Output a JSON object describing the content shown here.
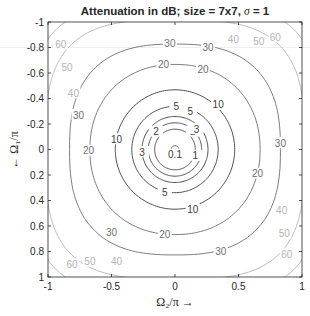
{
  "chart_data": {
    "type": "contour",
    "title": "Attenuation in dB; size = 7x7, σ = 1",
    "title_parts": {
      "prefix": "Attenuation in dB; size = 7x7, ",
      "sigma": "σ",
      "suffix": " = 1"
    },
    "xlabel": "Ω₂/π →",
    "ylabel": "← Ω₁/π",
    "xlim": [
      -1,
      1
    ],
    "ylim": [
      -1,
      1
    ],
    "y_axis_reversed": true,
    "grid": false,
    "x_ticks": [
      -1,
      -0.5,
      0,
      0.5,
      1
    ],
    "x_tick_labels": [
      "-1",
      "-0.5",
      "0",
      "0.5",
      "1"
    ],
    "y_ticks": [
      -1,
      -0.8,
      -0.6,
      -0.4,
      -0.2,
      0,
      0.2,
      0.4,
      0.6,
      0.8,
      1
    ],
    "y_tick_labels": [
      "-1",
      "-0.8",
      "-0.6",
      "-0.4",
      "-0.2",
      "0",
      "0.2",
      "0.4",
      "0.6",
      "0.8",
      "1"
    ],
    "contour_levels": [
      0.1,
      1,
      2,
      3,
      5,
      10,
      20,
      30,
      40,
      50,
      60
    ],
    "contour_shape": "concentric around origin; levels 0.1–20 near-circular, 30 rounded-square, 40/50/60 arcs in the four corners",
    "contour_radii_normalized": {
      "0.1": 0.03,
      "1": 0.16,
      "2": 0.21,
      "3": 0.26,
      "5": 0.34,
      "10": 0.47,
      "20": 0.67,
      "30": 0.83
    },
    "labels_visible": [
      {
        "level": "60",
        "x": -0.9,
        "y": -0.82
      },
      {
        "level": "50",
        "x": -0.85,
        "y": -0.64
      },
      {
        "level": "40",
        "x": -0.8,
        "y": -0.44
      },
      {
        "level": "30",
        "x": -0.76,
        "y": -0.27
      },
      {
        "level": "20",
        "x": -0.68,
        "y": 0.01
      },
      {
        "level": "10",
        "x": -0.46,
        "y": -0.08
      },
      {
        "level": "3",
        "x": -0.26,
        "y": 0.02
      },
      {
        "level": "2",
        "x": -0.15,
        "y": -0.14
      },
      {
        "level": "0.1",
        "x": 0.0,
        "y": 0.04
      },
      {
        "level": "1",
        "x": 0.16,
        "y": 0.05
      },
      {
        "level": "2",
        "x": 0.14,
        "y": -0.14
      },
      {
        "level": "3",
        "x": 0.17,
        "y": -0.16
      },
      {
        "level": "5",
        "x": 0.01,
        "y": -0.34
      },
      {
        "level": "5",
        "x": 0.12,
        "y": -0.3
      },
      {
        "level": "5",
        "x": -0.08,
        "y": 0.34
      },
      {
        "level": "10",
        "x": 0.34,
        "y": -0.35
      },
      {
        "level": "10",
        "x": 0.14,
        "y": 0.47
      },
      {
        "level": "20",
        "x": -0.09,
        "y": -0.67
      },
      {
        "level": "20",
        "x": 0.22,
        "y": -0.63
      },
      {
        "level": "20",
        "x": 0.65,
        "y": 0.19
      },
      {
        "level": "20",
        "x": -0.08,
        "y": 0.67
      },
      {
        "level": "30",
        "x": -0.04,
        "y": -0.83
      },
      {
        "level": "30",
        "x": 0.26,
        "y": -0.8
      },
      {
        "level": "30",
        "x": 0.83,
        "y": -0.05
      },
      {
        "level": "30",
        "x": -0.5,
        "y": 0.65
      },
      {
        "level": "30",
        "x": 0.36,
        "y": 0.8
      },
      {
        "level": "40",
        "x": 0.46,
        "y": -0.86
      },
      {
        "level": "40",
        "x": 0.84,
        "y": 0.48
      },
      {
        "level": "40",
        "x": -0.46,
        "y": 0.88
      },
      {
        "level": "50",
        "x": 0.66,
        "y": -0.85
      },
      {
        "level": "50",
        "x": 0.86,
        "y": 0.66
      },
      {
        "level": "50",
        "x": -0.67,
        "y": 0.88
      },
      {
        "level": "60",
        "x": 0.79,
        "y": -0.88
      },
      {
        "level": "60",
        "x": 0.88,
        "y": 0.82
      },
      {
        "level": "60",
        "x": -0.81,
        "y": 0.9
      }
    ]
  },
  "colors": {
    "inner_contours": "#3c3c3c",
    "mid_contours": "#6e6e6e",
    "outer_contours": "#b4b4b4",
    "axes": "#262626",
    "background": "#ffffff"
  }
}
